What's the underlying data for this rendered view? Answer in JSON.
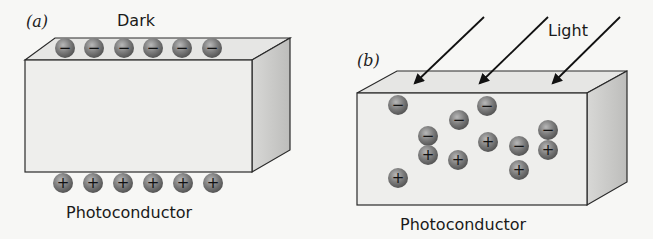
{
  "panel_a": {
    "label": "(a)",
    "condition": "Dark",
    "material": "Photoconductor",
    "top_charges": [
      "−",
      "−",
      "−",
      "−",
      "−",
      "−"
    ],
    "bottom_charges": [
      "+",
      "+",
      "+",
      "+",
      "+",
      "+"
    ]
  },
  "panel_b": {
    "label": "(b)",
    "condition": "Light",
    "material": "Photoconductor",
    "arrow_count": 3,
    "charges": [
      {
        "sign": "−",
        "x": 398,
        "y": 105
      },
      {
        "sign": "−",
        "x": 487,
        "y": 106
      },
      {
        "sign": "−",
        "x": 459,
        "y": 120
      },
      {
        "sign": "−",
        "x": 428,
        "y": 136
      },
      {
        "sign": "+",
        "x": 428,
        "y": 155
      },
      {
        "sign": "+",
        "x": 458,
        "y": 160
      },
      {
        "sign": "+",
        "x": 488,
        "y": 142
      },
      {
        "sign": "−",
        "x": 519,
        "y": 146
      },
      {
        "sign": "+",
        "x": 519,
        "y": 170
      },
      {
        "sign": "−",
        "x": 548,
        "y": 130
      },
      {
        "sign": "+",
        "x": 548,
        "y": 150
      },
      {
        "sign": "+",
        "x": 398,
        "y": 178
      }
    ]
  },
  "colors": {
    "background": "#f7f7f5",
    "box_front": "#ececea",
    "box_top": "#e4e4e2",
    "box_side": "#c8c8c6",
    "edge": "#2a2a2a",
    "charge": "#7a7a7a"
  }
}
